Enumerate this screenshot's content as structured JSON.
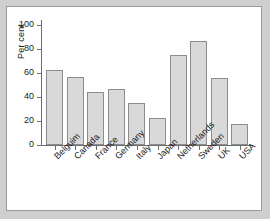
{
  "chart_data": {
    "type": "bar",
    "title": "",
    "xlabel": "",
    "ylabel": "Per cent",
    "ylim": [
      0,
      100
    ],
    "yticks": [
      0,
      20,
      40,
      60,
      80,
      100
    ],
    "ytick_labels": [
      "0",
      "20",
      "40",
      "60",
      "80",
      "100"
    ],
    "grid": false,
    "legend": "none",
    "categories": [
      "Belguim",
      "Canada",
      "France",
      "Germany",
      "Italy",
      "Japan",
      "Netherlands",
      "Sweden",
      "UK",
      "USA"
    ],
    "values": [
      62.5,
      56.5,
      44.5,
      47,
      35,
      22.5,
      75,
      87,
      56,
      17.5
    ],
    "bar_fill_color": "#d9d9d9",
    "bar_edge_color": "#8c8c8c",
    "axis_color": "#6e6e6e",
    "panel_background": "#ffffff",
    "figure_background": "#cfcfcf"
  }
}
